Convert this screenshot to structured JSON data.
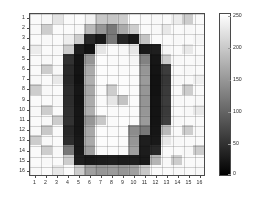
{
  "figure": {
    "title": "",
    "background_color": "#ffffff",
    "axis_color": "#4a4a4a",
    "text_color": "#2b2b2b"
  },
  "axes": {
    "xlabel": "",
    "ylabel": "",
    "xticks": [
      "1",
      "2",
      "3",
      "4",
      "5",
      "6",
      "7",
      "8",
      "9",
      "10",
      "11",
      "12",
      "13",
      "14",
      "15",
      "16"
    ],
    "yticks": [
      "1",
      "2",
      "3",
      "4",
      "5",
      "6",
      "7",
      "8",
      "9",
      "10",
      "11",
      "12",
      "13",
      "14",
      "15",
      "16"
    ],
    "grid": true
  },
  "colorbar": {
    "ticks": [
      "250",
      "200",
      "150",
      "100",
      "50",
      "0"
    ],
    "tick_values": [
      250,
      200,
      150,
      100,
      50,
      0
    ],
    "min": 0,
    "max": 255,
    "colormap": "gray",
    "low_color": "#000000",
    "high_color": "#ffffff"
  },
  "chart_data": {
    "type": "heatmap",
    "title": "",
    "xlabel": "",
    "ylabel": "",
    "colormap": "gray",
    "vmin": 0,
    "vmax": 255,
    "xticklabels": [
      "1",
      "2",
      "3",
      "4",
      "5",
      "6",
      "7",
      "8",
      "9",
      "10",
      "11",
      "12",
      "13",
      "14",
      "15",
      "16"
    ],
    "yticklabels": [
      "1",
      "2",
      "3",
      "4",
      "5",
      "6",
      "7",
      "8",
      "9",
      "10",
      "11",
      "12",
      "13",
      "14",
      "15",
      "16"
    ],
    "colorbar_ticks": [
      0,
      50,
      100,
      150,
      200,
      250
    ],
    "legend_position": "right",
    "grid": true,
    "rows": 16,
    "cols": 16,
    "values": [
      [
        250,
        248,
        228,
        250,
        252,
        242,
        200,
        198,
        205,
        252,
        250,
        248,
        250,
        236,
        205,
        250
      ],
      [
        248,
        205,
        250,
        250,
        248,
        186,
        150,
        120,
        170,
        205,
        250,
        248,
        232,
        250,
        248,
        250
      ],
      [
        250,
        248,
        250,
        238,
        205,
        40,
        25,
        120,
        38,
        25,
        195,
        250,
        250,
        248,
        250,
        246
      ],
      [
        236,
        250,
        248,
        205,
        30,
        18,
        230,
        250,
        248,
        230,
        25,
        30,
        246,
        250,
        232,
        250
      ],
      [
        250,
        248,
        250,
        50,
        20,
        150,
        252,
        250,
        250,
        245,
        130,
        22,
        205,
        248,
        250,
        248
      ],
      [
        250,
        205,
        248,
        42,
        20,
        170,
        252,
        252,
        250,
        250,
        150,
        20,
        60,
        250,
        248,
        250
      ],
      [
        248,
        250,
        232,
        40,
        18,
        175,
        252,
        252,
        252,
        250,
        155,
        18,
        55,
        248,
        250,
        240
      ],
      [
        205,
        248,
        250,
        45,
        22,
        168,
        250,
        205,
        252,
        250,
        150,
        18,
        58,
        250,
        205,
        250
      ],
      [
        250,
        250,
        248,
        45,
        20,
        172,
        250,
        230,
        195,
        250,
        148,
        20,
        60,
        248,
        250,
        248
      ],
      [
        248,
        205,
        250,
        48,
        22,
        175,
        252,
        250,
        250,
        250,
        150,
        20,
        58,
        250,
        248,
        232
      ],
      [
        250,
        248,
        205,
        50,
        22,
        150,
        200,
        250,
        252,
        250,
        155,
        20,
        62,
        248,
        250,
        250
      ],
      [
        248,
        200,
        250,
        40,
        22,
        168,
        252,
        250,
        250,
        140,
        120,
        22,
        185,
        250,
        205,
        248
      ],
      [
        205,
        248,
        250,
        45,
        25,
        170,
        252,
        252,
        250,
        150,
        30,
        25,
        232,
        248,
        250,
        250
      ],
      [
        250,
        205,
        248,
        120,
        25,
        160,
        250,
        250,
        248,
        160,
        28,
        40,
        250,
        250,
        248,
        205
      ],
      [
        250,
        248,
        250,
        205,
        30,
        25,
        28,
        30,
        28,
        30,
        25,
        180,
        248,
        205,
        250,
        250
      ],
      [
        248,
        250,
        232,
        250,
        205,
        160,
        150,
        155,
        150,
        160,
        200,
        250,
        250,
        248,
        250,
        248
      ]
    ]
  }
}
